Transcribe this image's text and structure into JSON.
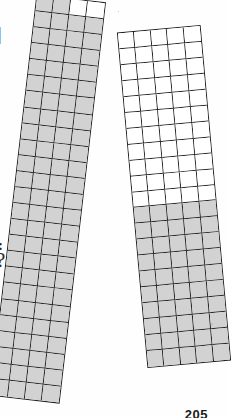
{
  "page": {
    "background_color": "#ffffff",
    "page_number": "205"
  },
  "palette": {
    "shaded_cell": "#d2d2d2",
    "empty_cell": "#ffffff",
    "grid_line": "#222222",
    "outer_border": "#1e1e1e",
    "ink": "#2a2a2a"
  },
  "margin_artifacts": [
    {
      "name": "vertical-bar-fragment",
      "text": "|"
    },
    {
      "name": "colon-fragment",
      "text": ":"
    },
    {
      "name": "question-mark-fragment",
      "text": "?"
    }
  ],
  "chart_data": {
    "type": "heatmap",
    "xlabel": "",
    "ylabel": "",
    "grid": true,
    "legend_position": "none",
    "annotations": [
      "205"
    ],
    "grids": [
      {
        "name": "left-grid-strip",
        "columns": 4,
        "rows": 25,
        "total_cells": 100,
        "shaded_cells": 98,
        "empty_cells": 2,
        "fraction_shaded": "98/100",
        "rotation_degrees": 6.6,
        "shading_pattern": "all cells shaded except the two right-hand cells of the top row",
        "rows_detail": [
          {
            "row": 1,
            "shaded": [
              1,
              1,
              0,
              0
            ]
          },
          {
            "row": 2,
            "shaded": [
              1,
              1,
              1,
              1
            ]
          },
          {
            "row": 3,
            "shaded": [
              1,
              1,
              1,
              1
            ]
          },
          {
            "row": 4,
            "shaded": [
              1,
              1,
              1,
              1
            ]
          },
          {
            "row": 5,
            "shaded": [
              1,
              1,
              1,
              1
            ]
          },
          {
            "row": 6,
            "shaded": [
              1,
              1,
              1,
              1
            ]
          },
          {
            "row": 7,
            "shaded": [
              1,
              1,
              1,
              1
            ]
          },
          {
            "row": 8,
            "shaded": [
              1,
              1,
              1,
              1
            ]
          },
          {
            "row": 9,
            "shaded": [
              1,
              1,
              1,
              1
            ]
          },
          {
            "row": 10,
            "shaded": [
              1,
              1,
              1,
              1
            ]
          },
          {
            "row": 11,
            "shaded": [
              1,
              1,
              1,
              1
            ]
          },
          {
            "row": 12,
            "shaded": [
              1,
              1,
              1,
              1
            ]
          },
          {
            "row": 13,
            "shaded": [
              1,
              1,
              1,
              1
            ]
          },
          {
            "row": 14,
            "shaded": [
              1,
              1,
              1,
              1
            ]
          },
          {
            "row": 15,
            "shaded": [
              1,
              1,
              1,
              1
            ]
          },
          {
            "row": 16,
            "shaded": [
              1,
              1,
              1,
              1
            ]
          },
          {
            "row": 17,
            "shaded": [
              1,
              1,
              1,
              1
            ]
          },
          {
            "row": 18,
            "shaded": [
              1,
              1,
              1,
              1
            ]
          },
          {
            "row": 19,
            "shaded": [
              1,
              1,
              1,
              1
            ]
          },
          {
            "row": 20,
            "shaded": [
              1,
              1,
              1,
              1
            ]
          },
          {
            "row": 21,
            "shaded": [
              1,
              1,
              1,
              1
            ]
          },
          {
            "row": 22,
            "shaded": [
              1,
              1,
              1,
              1
            ]
          },
          {
            "row": 23,
            "shaded": [
              1,
              1,
              1,
              1
            ]
          },
          {
            "row": 24,
            "shaded": [
              1,
              1,
              1,
              1
            ]
          },
          {
            "row": 25,
            "shaded": [
              1,
              1,
              1,
              1
            ]
          }
        ]
      },
      {
        "name": "right-grid-strip",
        "columns": 5,
        "rows": 21,
        "total_cells": 105,
        "shaded_cells": 50,
        "empty_cells": 55,
        "fraction_shaded": "50/105",
        "rotation_degrees": -5.2,
        "shading_pattern": "top 11 rows empty, bottom 10 rows fully shaded",
        "rows_detail": [
          {
            "row": 1,
            "shaded": [
              0,
              0,
              0,
              0,
              0
            ]
          },
          {
            "row": 2,
            "shaded": [
              0,
              0,
              0,
              0,
              0
            ]
          },
          {
            "row": 3,
            "shaded": [
              0,
              0,
              0,
              0,
              0
            ]
          },
          {
            "row": 4,
            "shaded": [
              0,
              0,
              0,
              0,
              0
            ]
          },
          {
            "row": 5,
            "shaded": [
              0,
              0,
              0,
              0,
              0
            ]
          },
          {
            "row": 6,
            "shaded": [
              0,
              0,
              0,
              0,
              0
            ]
          },
          {
            "row": 7,
            "shaded": [
              0,
              0,
              0,
              0,
              0
            ]
          },
          {
            "row": 8,
            "shaded": [
              0,
              0,
              0,
              0,
              0
            ]
          },
          {
            "row": 9,
            "shaded": [
              0,
              0,
              0,
              0,
              0
            ]
          },
          {
            "row": 10,
            "shaded": [
              0,
              0,
              0,
              0,
              0
            ]
          },
          {
            "row": 11,
            "shaded": [
              0,
              0,
              0,
              0,
              0
            ]
          },
          {
            "row": 12,
            "shaded": [
              1,
              1,
              1,
              1,
              1
            ]
          },
          {
            "row": 13,
            "shaded": [
              1,
              1,
              1,
              1,
              1
            ]
          },
          {
            "row": 14,
            "shaded": [
              1,
              1,
              1,
              1,
              1
            ]
          },
          {
            "row": 15,
            "shaded": [
              1,
              1,
              1,
              1,
              1
            ]
          },
          {
            "row": 16,
            "shaded": [
              1,
              1,
              1,
              1,
              1
            ]
          },
          {
            "row": 17,
            "shaded": [
              1,
              1,
              1,
              1,
              1
            ]
          },
          {
            "row": 18,
            "shaded": [
              1,
              1,
              1,
              1,
              1
            ]
          },
          {
            "row": 19,
            "shaded": [
              1,
              1,
              1,
              1,
              1
            ]
          },
          {
            "row": 20,
            "shaded": [
              1,
              1,
              1,
              1,
              1
            ]
          },
          {
            "row": 21,
            "shaded": [
              1,
              1,
              1,
              1,
              1
            ]
          }
        ]
      }
    ]
  }
}
